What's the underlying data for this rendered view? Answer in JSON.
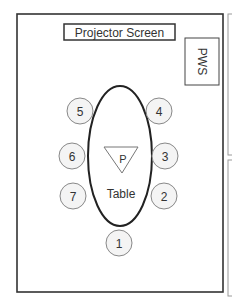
{
  "diagram": {
    "type": "room-seating-layout",
    "projector_screen": {
      "label": "Projector Screen"
    },
    "pws": {
      "label": "PWS"
    },
    "table": {
      "label": "Table",
      "presenter_marker": "P"
    },
    "seats": [
      {
        "number": "1",
        "cx": 119,
        "cy": 243
      },
      {
        "number": "2",
        "cx": 164,
        "cy": 196
      },
      {
        "number": "3",
        "cx": 164,
        "cy": 156
      },
      {
        "number": "4",
        "cx": 159,
        "cy": 111
      },
      {
        "number": "5",
        "cx": 80,
        "cy": 111
      },
      {
        "number": "6",
        "cx": 71,
        "cy": 156
      },
      {
        "number": "7",
        "cx": 73,
        "cy": 196
      }
    ],
    "colors": {
      "border": "#333333",
      "seat_fill": "#f4f4f4",
      "seat_stroke": "#888888",
      "text": "#333333",
      "side_panel": "#999999"
    }
  }
}
